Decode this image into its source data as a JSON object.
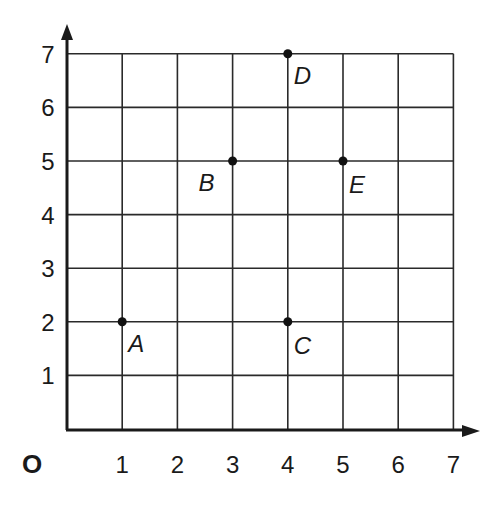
{
  "chart_data": {
    "type": "scatter",
    "title": "",
    "xlabel": "",
    "ylabel": "",
    "origin_label": "O",
    "xlim": [
      0,
      7
    ],
    "ylim": [
      0,
      7
    ],
    "grid": true,
    "x_ticks": [
      "1",
      "2",
      "3",
      "4",
      "5",
      "6",
      "7"
    ],
    "y_ticks": [
      "1",
      "2",
      "3",
      "4",
      "5",
      "6",
      "7"
    ],
    "points": [
      {
        "label": "A",
        "x": 1,
        "y": 2
      },
      {
        "label": "B",
        "x": 3,
        "y": 5
      },
      {
        "label": "C",
        "x": 4,
        "y": 2
      },
      {
        "label": "D",
        "x": 4,
        "y": 7
      },
      {
        "label": "E",
        "x": 5,
        "y": 5
      }
    ],
    "colors": {
      "line": "#2a2a2a",
      "point": "#111111",
      "text": "#1a1a1a"
    }
  }
}
